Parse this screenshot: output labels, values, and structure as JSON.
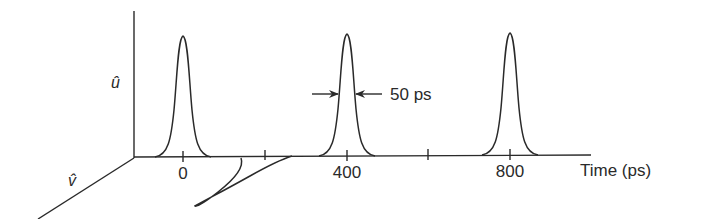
{
  "figure": {
    "axes": {
      "vertical_label": "û",
      "oblique_label": "v̂",
      "horizontal_label": "Time (ps)"
    },
    "ticks": [
      {
        "value": 0,
        "label": "0"
      },
      {
        "value": 200,
        "label": ""
      },
      {
        "value": 400,
        "label": "400"
      },
      {
        "value": 600,
        "label": ""
      },
      {
        "value": 800,
        "label": "800"
      }
    ],
    "annotation": {
      "width_label": "50 ps"
    },
    "pulses": [
      {
        "center_ps": 0,
        "plane": "u"
      },
      {
        "center_ps": 400,
        "plane": "u"
      },
      {
        "center_ps": 800,
        "plane": "u"
      },
      {
        "center_ps": 200,
        "plane": "v",
        "note": "distorted pulse"
      }
    ]
  }
}
